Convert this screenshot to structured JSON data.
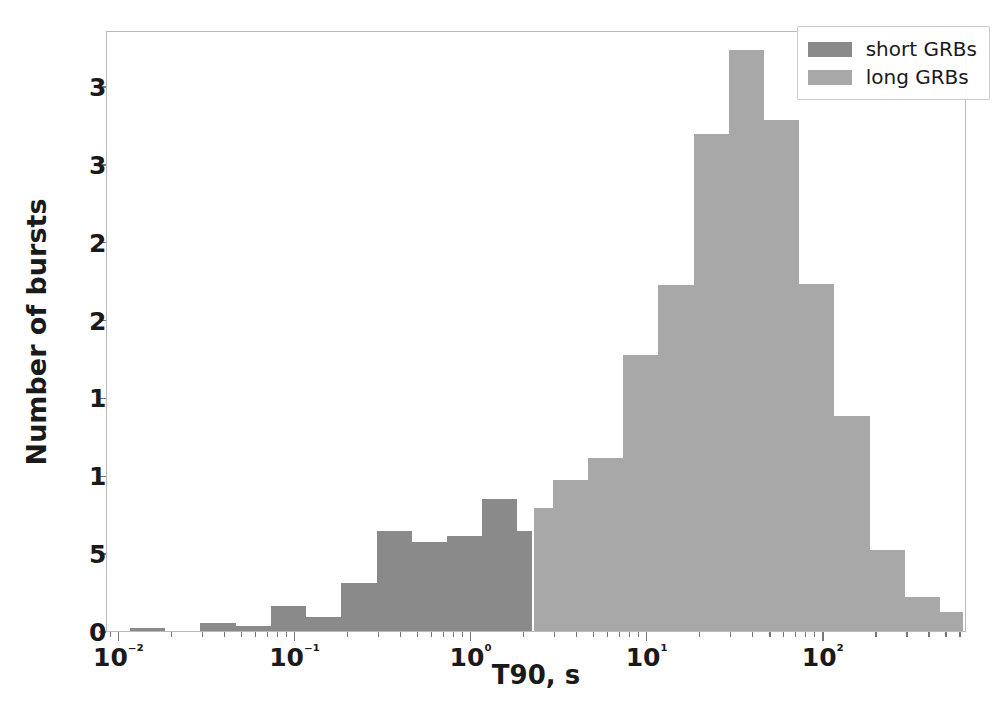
{
  "chart_data": {
    "type": "bar",
    "title": "",
    "subtitle": "",
    "xlabel": "T90, s",
    "ylabel": "Number of bursts",
    "xscale": "log",
    "yscale": "linear",
    "xlim": [
      0.0085,
      650
    ],
    "ylim": [
      0,
      386
    ],
    "grid": false,
    "legend_position": "upper right",
    "y_ticks": [
      0,
      50,
      100,
      150,
      200,
      250,
      300,
      350
    ],
    "x_ticks": [
      "10-2",
      "10-1",
      "100",
      "101",
      "102"
    ],
    "x_tick_labels": [
      "10⁻²",
      "10⁻¹",
      "10⁰",
      "10¹",
      "10²"
    ],
    "x_tick_values": [
      0.01,
      0.1,
      1,
      10,
      100
    ],
    "bin_edges": [
      0.0115,
      0.0182,
      0.0288,
      0.0457,
      0.0724,
      0.1148,
      0.182,
      0.2884,
      0.4571,
      0.7244,
      1.1482,
      1.8197,
      2.884,
      4.571,
      7.244,
      11.482,
      18.197,
      28.84,
      45.71,
      72.44,
      114.82,
      181.97,
      288.4,
      457.1
    ],
    "series": [
      {
        "name": "short GRBs",
        "color": "#8a8a8a",
        "bins": [
          {
            "lo": 0.0115,
            "hi": 0.0182,
            "count": 2
          },
          {
            "lo": 0.0182,
            "hi": 0.0288,
            "count": 0
          },
          {
            "lo": 0.0288,
            "hi": 0.0457,
            "count": 5
          },
          {
            "lo": 0.0457,
            "hi": 0.0724,
            "count": 3
          },
          {
            "lo": 0.0724,
            "hi": 0.1148,
            "count": 16
          },
          {
            "lo": 0.1148,
            "hi": 0.182,
            "count": 9
          },
          {
            "lo": 0.182,
            "hi": 0.2884,
            "count": 31
          },
          {
            "lo": 0.2884,
            "hi": 0.4571,
            "count": 64
          },
          {
            "lo": 0.4571,
            "hi": 0.7244,
            "count": 57
          },
          {
            "lo": 0.7244,
            "hi": 1.1482,
            "count": 61
          },
          {
            "lo": 1.1482,
            "hi": 1.8197,
            "count": 85
          },
          {
            "lo": 1.8197,
            "hi": 2.2,
            "count": 64
          }
        ]
      },
      {
        "name": "long GRBs",
        "color": "#a8a8a8",
        "bins": [
          {
            "lo": 2.25,
            "hi": 2.884,
            "count": 79
          },
          {
            "lo": 2.884,
            "hi": 4.571,
            "count": 97
          },
          {
            "lo": 4.571,
            "hi": 7.244,
            "count": 111
          },
          {
            "lo": 7.244,
            "hi": 11.482,
            "count": 177
          },
          {
            "lo": 11.482,
            "hi": 18.197,
            "count": 222
          },
          {
            "lo": 18.197,
            "hi": 28.84,
            "count": 319
          },
          {
            "lo": 28.84,
            "hi": 45.71,
            "count": 373
          },
          {
            "lo": 45.71,
            "hi": 72.44,
            "count": 328
          },
          {
            "lo": 72.44,
            "hi": 114.82,
            "count": 223
          },
          {
            "lo": 114.82,
            "hi": 181.97,
            "count": 138
          },
          {
            "lo": 181.97,
            "hi": 288.4,
            "count": 52
          },
          {
            "lo": 288.4,
            "hi": 457.1,
            "count": 22
          },
          {
            "lo": 457.1,
            "hi": 620.0,
            "count": 12
          }
        ]
      }
    ]
  },
  "legend": {
    "entries": [
      {
        "label": "short GRBs",
        "color": "#8a8a8a"
      },
      {
        "label": "long GRBs",
        "color": "#a8a8a8"
      }
    ]
  },
  "axes": {
    "x_title": "T90, s",
    "y_title": "Number of bursts"
  }
}
